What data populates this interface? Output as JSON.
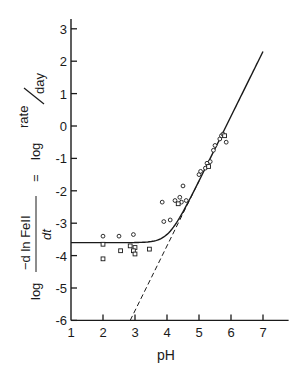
{
  "chart_data": {
    "type": "scatter",
    "title": "",
    "xlabel": "pH",
    "ylabel": "log (−d ln FeII / dt) = log rate/day",
    "ylabel_parts": {
      "log1": "log",
      "numerator": "−d ln FeII",
      "denominator": "dt",
      "equals": "=",
      "log2": "log",
      "rate": "rate",
      "day": "day"
    },
    "xlim": [
      1,
      7.8
    ],
    "ylim": [
      -6,
      3.3
    ],
    "x_ticks": [
      1,
      2,
      3,
      4,
      5,
      6,
      7
    ],
    "y_ticks": [
      3,
      2,
      1,
      0,
      -1,
      -2,
      -3,
      -4,
      -5,
      -6
    ],
    "x_tick_labels": [
      "1",
      "2",
      "3",
      "4",
      "5",
      "6",
      "7"
    ],
    "y_tick_labels": [
      "3",
      "2",
      "1",
      "0",
      "-1",
      "-2",
      "-3",
      "-4",
      "-5",
      "-6"
    ],
    "grid": false,
    "legend": null,
    "series": [
      {
        "name": "circles",
        "marker": "circle",
        "points": [
          [
            2.0,
            -3.4
          ],
          [
            2.5,
            -3.4
          ],
          [
            2.95,
            -3.35
          ],
          [
            3.9,
            -2.95
          ],
          [
            4.1,
            -2.9
          ],
          [
            3.85,
            -2.35
          ],
          [
            4.25,
            -2.3
          ],
          [
            4.4,
            -2.2
          ],
          [
            4.5,
            -1.85
          ],
          [
            4.45,
            -2.35
          ],
          [
            4.6,
            -2.3
          ],
          [
            5.0,
            -1.5
          ],
          [
            5.05,
            -1.4
          ],
          [
            5.2,
            -1.3
          ],
          [
            5.25,
            -1.15
          ],
          [
            5.35,
            -1.1
          ],
          [
            5.45,
            -0.75
          ],
          [
            5.5,
            -0.6
          ],
          [
            5.65,
            -0.4
          ],
          [
            5.7,
            -0.3
          ],
          [
            5.75,
            -0.25
          ],
          [
            5.85,
            -0.5
          ]
        ]
      },
      {
        "name": "squares",
        "marker": "square",
        "points": [
          [
            2.0,
            -3.65
          ],
          [
            2.0,
            -4.1
          ],
          [
            2.55,
            -3.85
          ],
          [
            2.85,
            -3.7
          ],
          [
            3.0,
            -3.75
          ],
          [
            2.95,
            -3.85
          ],
          [
            3.0,
            -3.95
          ],
          [
            3.45,
            -3.8
          ],
          [
            4.35,
            -2.4
          ],
          [
            5.3,
            -1.25
          ],
          [
            5.8,
            -0.3
          ]
        ]
      },
      {
        "name": "fitted curve",
        "style": "solid",
        "description": "plateau at about -3.6 for pH < 3, curving into a straight line of slope 2 above pH ~5",
        "plateau": -3.6,
        "slope": 2,
        "end_point": [
          7.0,
          2.3
        ]
      },
      {
        "name": "asymptote",
        "style": "dashed",
        "points": [
          [
            2.85,
            -6.0
          ],
          [
            5.0,
            -1.7
          ]
        ]
      }
    ]
  }
}
